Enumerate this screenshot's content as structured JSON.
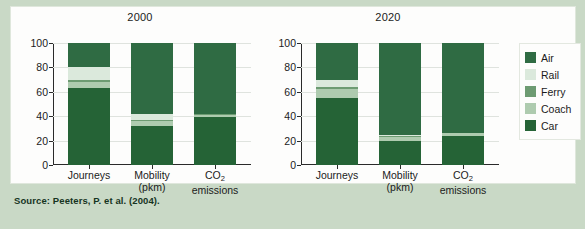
{
  "source_note": "Source: Peeters, P. et al. (2004).",
  "legend": {
    "position": "right",
    "items": [
      {
        "label": "Air",
        "color": "#2f6b43"
      },
      {
        "label": "Rail",
        "color": "#dbe9dc"
      },
      {
        "label": "Ferry",
        "color": "#6d9b72"
      },
      {
        "label": "Coach",
        "color": "#aecbaf"
      },
      {
        "label": "Car",
        "color": "#256336"
      }
    ]
  },
  "yticks": [
    0,
    20,
    40,
    60,
    80,
    100
  ],
  "categories_display": [
    {
      "line1": "Journeys",
      "line2": ""
    },
    {
      "line1": "Mobility",
      "line2": "(pkm)"
    },
    {
      "line1": "CO",
      "sub": "2",
      "line2": "emissions"
    }
  ],
  "chart_data": [
    {
      "type": "bar",
      "title": "2000",
      "stacked": true,
      "xlabel": "",
      "ylabel": "",
      "ylim": [
        0,
        100
      ],
      "grid": true,
      "categories": [
        "Journeys",
        "Mobility (pkm)",
        "CO2 emissions"
      ],
      "series": [
        {
          "name": "Car",
          "color": "#256336",
          "values": [
            63,
            32,
            39
          ]
        },
        {
          "name": "Coach",
          "color": "#aecbaf",
          "values": [
            5,
            4,
            2
          ]
        },
        {
          "name": "Ferry",
          "color": "#6d9b72",
          "values": [
            2,
            1,
            1
          ]
        },
        {
          "name": "Rail",
          "color": "#dbe9dc",
          "values": [
            10,
            5,
            0
          ]
        },
        {
          "name": "Air",
          "color": "#2f6b43",
          "values": [
            20,
            58,
            58
          ]
        }
      ]
    },
    {
      "type": "bar",
      "title": "2020",
      "stacked": true,
      "xlabel": "",
      "ylabel": "",
      "ylim": [
        0,
        100
      ],
      "grid": true,
      "categories": [
        "Journeys",
        "Mobility (pkm)",
        "CO2 emissions"
      ],
      "series": [
        {
          "name": "Car",
          "color": "#256336",
          "values": [
            55,
            20,
            24
          ]
        },
        {
          "name": "Coach",
          "color": "#aecbaf",
          "values": [
            7,
            3,
            2
          ]
        },
        {
          "name": "Ferry",
          "color": "#6d9b72",
          "values": [
            2,
            1,
            0
          ]
        },
        {
          "name": "Rail",
          "color": "#dbe9dc",
          "values": [
            6,
            1,
            0
          ]
        },
        {
          "name": "Air",
          "color": "#2f6b43",
          "values": [
            30,
            75,
            74
          ]
        }
      ]
    }
  ]
}
